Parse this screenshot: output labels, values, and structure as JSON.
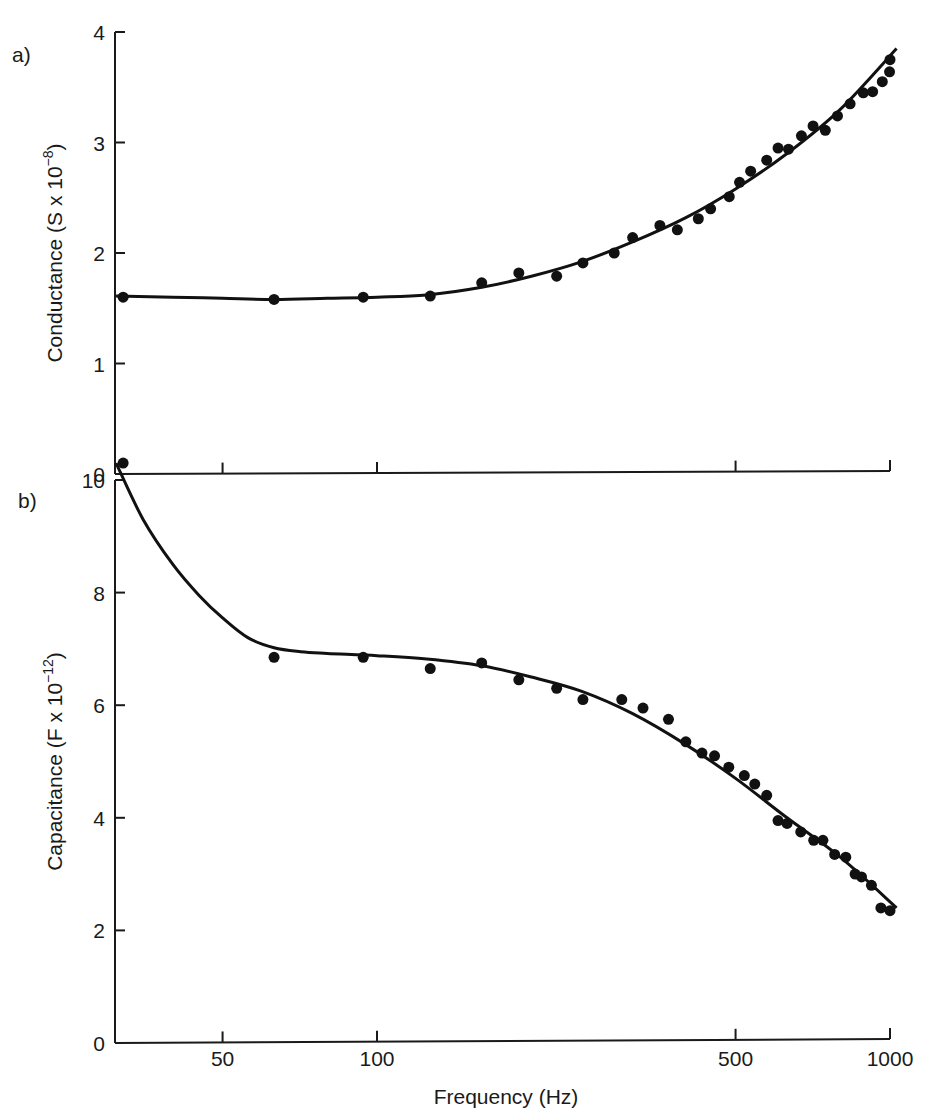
{
  "chart_data": [
    {
      "type": "scatter",
      "panel_label": "a)",
      "title": "",
      "xlabel": "Frequency (Hz)",
      "ylabel": "Conductance (S x 10^-8)",
      "ylabel_parts": {
        "main": "Conductance (S x 10",
        "sup": "−8",
        "close": ")"
      },
      "xscale": "log",
      "xlim": [
        31,
        1030
      ],
      "ylim": [
        0,
        4
      ],
      "yticks": [
        0,
        1,
        2,
        3,
        4
      ],
      "xticks": [
        50,
        100,
        500,
        1000
      ],
      "grid": false,
      "legend": "none",
      "series": [
        {
          "name": "measured",
          "style": "markers",
          "x": [
            32,
            63,
            94,
            127,
            160,
            189,
            224,
            252,
            290,
            315,
            356,
            385,
            423,
            447,
            486,
            509,
            535,
            575,
            605,
            634,
            672,
            708,
            748,
            790,
            836,
            887,
            925,
            966,
            998,
            1000
          ],
          "y": [
            1.6,
            1.58,
            1.6,
            1.61,
            1.73,
            1.82,
            1.79,
            1.91,
            2.0,
            2.14,
            2.25,
            2.21,
            2.31,
            2.4,
            2.51,
            2.64,
            2.74,
            2.84,
            2.95,
            2.94,
            3.06,
            3.15,
            3.11,
            3.24,
            3.35,
            3.45,
            3.46,
            3.55,
            3.64,
            3.75
          ]
        },
        {
          "name": "fit",
          "style": "line",
          "x": [
            31,
            40,
            50,
            63,
            80,
            100,
            125,
            160,
            200,
            250,
            315,
            400,
            500,
            630,
            800,
            1030
          ],
          "y": [
            1.61,
            1.6,
            1.59,
            1.58,
            1.59,
            1.6,
            1.62,
            1.69,
            1.79,
            1.92,
            2.1,
            2.32,
            2.58,
            2.9,
            3.3,
            3.85
          ]
        }
      ]
    },
    {
      "type": "scatter",
      "panel_label": "b)",
      "title": "",
      "xlabel": "Frequency (Hz)",
      "ylabel": "Capacitance (F x 10^-12)",
      "ylabel_parts": {
        "main": "Capacitance (F x 10",
        "sup": "−12",
        "close": ")"
      },
      "xscale": "log",
      "xlim": [
        31,
        1030
      ],
      "ylim": [
        0,
        10
      ],
      "yticks": [
        0,
        2,
        4,
        6,
        8,
        10
      ],
      "xticks": [
        50,
        100,
        500,
        1000
      ],
      "grid": false,
      "legend": "none",
      "series": [
        {
          "name": "measured",
          "style": "markers",
          "x": [
            32,
            63,
            94,
            127,
            160,
            189,
            224,
            252,
            300,
            330,
            370,
            400,
            430,
            455,
            485,
            520,
            545,
            575,
            605,
            630,
            670,
            710,
            740,
            780,
            820,
            855,
            880,
            920,
            960,
            1000
          ],
          "y": [
            10.3,
            6.85,
            6.85,
            6.65,
            6.75,
            6.45,
            6.3,
            6.1,
            6.1,
            5.95,
            5.75,
            5.35,
            5.15,
            5.1,
            4.9,
            4.75,
            4.6,
            4.4,
            3.95,
            3.9,
            3.75,
            3.6,
            3.6,
            3.35,
            3.3,
            3.0,
            2.95,
            2.8,
            2.4,
            2.35
          ]
        },
        {
          "name": "fit",
          "style": "line",
          "x": [
            31,
            35,
            40,
            45,
            50,
            56,
            63,
            71,
            80,
            100,
            125,
            160,
            200,
            250,
            315,
            400,
            500,
            630,
            800,
            1030
          ],
          "y": [
            10.3,
            9.3,
            8.5,
            7.95,
            7.55,
            7.2,
            7.02,
            6.95,
            6.92,
            6.88,
            6.82,
            6.7,
            6.5,
            6.25,
            5.85,
            5.3,
            4.7,
            4.0,
            3.3,
            2.4
          ]
        }
      ]
    }
  ],
  "labels": {
    "panel_a": "a)",
    "panel_b": "b)",
    "xlabel": "Frequency (Hz)",
    "xtick_labels": [
      "50",
      "100",
      "500",
      "1000"
    ],
    "top_ytick_labels": [
      "0",
      "1",
      "2",
      "3",
      "4"
    ],
    "bottom_ytick_labels": [
      "0",
      "2",
      "4",
      "6",
      "8",
      "10"
    ]
  },
  "colors": {
    "ink": "#111111",
    "background": "#ffffff"
  }
}
